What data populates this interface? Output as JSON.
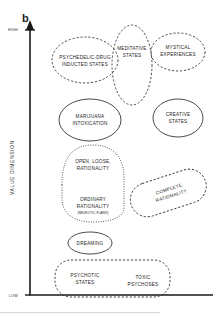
{
  "figure": {
    "panel_label": "b",
    "width": 217,
    "height": 318,
    "background": "#ffffff",
    "stroke_color": "#2b2b2b"
  },
  "axis": {
    "y_title": "VALUE DIMENSION",
    "y_high": "HIGH",
    "y_low": "LOW"
  },
  "regions": [
    {
      "id": "psychedelic-drug-induced-states",
      "lines": [
        "PSYCHEDELIC-DRUG",
        "INDUCTED STATES"
      ],
      "shape": "ellipse",
      "style": "dashed",
      "cx": 85,
      "cy": 60,
      "rx": 33,
      "ry": 23,
      "rotate": 0
    },
    {
      "id": "meditative-states",
      "lines": [
        "MEDITATIVE",
        "STATES"
      ],
      "shape": "ellipse",
      "style": "dashed",
      "cx": 132,
      "cy": 65,
      "rx": 20,
      "ry": 40,
      "rotate": 0
    },
    {
      "id": "mystical-experiences",
      "lines": [
        "MYSTICAL",
        "EXPERIENCES"
      ],
      "shape": "ellipse",
      "style": "dashed",
      "cx": 178,
      "cy": 52,
      "rx": 27,
      "ry": 19,
      "rotate": 0
    },
    {
      "id": "marijuana-intoxication",
      "lines": [
        "MARIJUANA",
        "INTOXICATION"
      ],
      "shape": "ellipse",
      "style": "solid",
      "cx": 90,
      "cy": 120,
      "rx": 31,
      "ry": 21,
      "rotate": 0
    },
    {
      "id": "creative-states",
      "lines": [
        "CREATIVE",
        "STATES"
      ],
      "shape": "ellipse",
      "style": "solid",
      "cx": 178,
      "cy": 118,
      "rx": 25,
      "ry": 19,
      "rotate": 0
    },
    {
      "id": "open-loose-rationality",
      "lines": [
        "OPEN, LOOSE,",
        "RATIONALITY"
      ],
      "shape": "blob",
      "style": "dotted",
      "cx": 93,
      "cy": 165,
      "rotate": 0
    },
    {
      "id": "ordinary-rationality",
      "lines": [
        "ORDINARY",
        "RATIONALITY"
      ],
      "sublabel": "(NEUROTIC FLAWS)",
      "shape": "blob",
      "style": "dotted",
      "cx": 93,
      "cy": 203,
      "rotate": 0
    },
    {
      "id": "complete-rationality",
      "lines": [
        "COMPLETE",
        "RATIONALITY"
      ],
      "shape": "capsule",
      "style": "dashed",
      "cx": 168,
      "cy": 192,
      "rotate": -18
    },
    {
      "id": "dreaming",
      "lines": [
        "DREAMING"
      ],
      "shape": "ellipse",
      "style": "solid",
      "cx": 90,
      "cy": 243,
      "rx": 22,
      "ry": 11,
      "rotate": 0
    },
    {
      "id": "psychotic-states",
      "lines": [
        "PSYCHOTIC",
        "STATES"
      ],
      "shape": "rounded-rect",
      "style": "dashed",
      "cx": 83,
      "cy": 277,
      "rotate": 0
    },
    {
      "id": "toxic-psychoses",
      "lines": [
        "TOXIC",
        "PSYCHOSES"
      ],
      "shape": "rounded-rect",
      "style": "dashed",
      "cx": 143,
      "cy": 279,
      "rotate": 0
    }
  ]
}
